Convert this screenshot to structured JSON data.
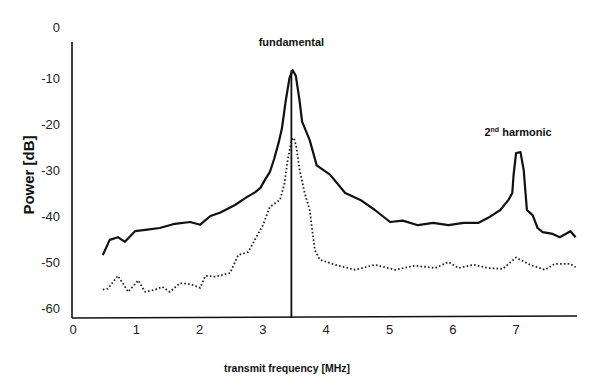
{
  "chart_data": {
    "type": "line",
    "title": "",
    "xlabel": "transmit frequency [MHz]",
    "ylabel": "Power [dB]",
    "xlim": [
      0,
      7.95
    ],
    "ylim": [
      -63,
      0
    ],
    "x_ticks": [
      0,
      1,
      2,
      3,
      4,
      5,
      6,
      7
    ],
    "y_ticks": [
      0,
      -10,
      -20,
      -30,
      -40,
      -50,
      -60
    ],
    "grid": false,
    "legend": null,
    "annotations": [
      {
        "text": "fundamental",
        "x": 3.45,
        "y": -2.5
      },
      {
        "text": "2nd harmonic",
        "sup": "nd",
        "base": "2",
        "rest": " harmonic",
        "x": 7.0,
        "y": -22.5
      }
    ],
    "vertical_line": {
      "x": 3.45,
      "y_from": -63,
      "y_to": -8.3
    },
    "series": [
      {
        "name": "solid",
        "style": "solid",
        "color": "#111111",
        "x": [
          0.47,
          0.58,
          0.71,
          0.82,
          0.98,
          1.14,
          1.37,
          1.61,
          1.85,
          2.01,
          2.17,
          2.32,
          2.56,
          2.72,
          2.88,
          2.96,
          3.03,
          3.11,
          3.18,
          3.25,
          3.3,
          3.36,
          3.42,
          3.47,
          3.52,
          3.58,
          3.62,
          3.74,
          3.85,
          4.06,
          4.3,
          4.54,
          4.77,
          5.01,
          5.21,
          5.45,
          5.69,
          5.93,
          6.17,
          6.4,
          6.56,
          6.75,
          6.88,
          6.94,
          6.96,
          7.0,
          7.07,
          7.12,
          7.17,
          7.26,
          7.34,
          7.42,
          7.58,
          7.69,
          7.86,
          7.94
        ],
        "y": [
          -48.5,
          -45.2,
          -44.6,
          -45.6,
          -43.3,
          -43.0,
          -42.6,
          -41.7,
          -41.3,
          -41.9,
          -40.0,
          -39.3,
          -37.6,
          -36.1,
          -34.8,
          -33.9,
          -32.2,
          -30.4,
          -27.5,
          -24.0,
          -21.0,
          -15.0,
          -10.0,
          -8.3,
          -9.5,
          -15.0,
          -19.5,
          -23.5,
          -29.0,
          -31.0,
          -35.0,
          -36.5,
          -38.7,
          -41.3,
          -41.0,
          -42.0,
          -41.5,
          -42.0,
          -41.5,
          -41.5,
          -40.4,
          -38.7,
          -36.5,
          -35.0,
          -31.0,
          -26.3,
          -26.1,
          -30.0,
          -38.7,
          -39.8,
          -42.6,
          -43.5,
          -43.9,
          -44.6,
          -43.3,
          -44.6
        ]
      },
      {
        "name": "dotted",
        "style": "dotted",
        "color": "#222222",
        "x": [
          0.47,
          0.55,
          0.71,
          0.79,
          0.87,
          1.03,
          1.14,
          1.3,
          1.41,
          1.53,
          1.69,
          1.85,
          2.01,
          2.09,
          2.25,
          2.48,
          2.61,
          2.77,
          2.88,
          3.0,
          3.11,
          3.27,
          3.34,
          3.39,
          3.45,
          3.49,
          3.53,
          3.58,
          3.66,
          3.74,
          3.82,
          3.9,
          4.14,
          4.46,
          4.77,
          5.09,
          5.4,
          5.72,
          5.93,
          6.09,
          6.33,
          6.56,
          6.79,
          7.0,
          7.22,
          7.46,
          7.61,
          7.85,
          7.94
        ],
        "y": [
          -56.0,
          -55.8,
          -53.0,
          -54.7,
          -56.5,
          -54.0,
          -56.5,
          -56.0,
          -55.4,
          -56.5,
          -54.6,
          -54.8,
          -55.6,
          -53.0,
          -53.2,
          -52.4,
          -48.5,
          -47.8,
          -45.0,
          -42.0,
          -38.0,
          -36.5,
          -33.0,
          -28.0,
          -23.5,
          -23.0,
          -25.0,
          -30.0,
          -35.0,
          -38.7,
          -47.4,
          -49.5,
          -50.6,
          -51.7,
          -50.6,
          -51.7,
          -50.8,
          -51.3,
          -50.0,
          -51.3,
          -50.6,
          -51.3,
          -51.5,
          -49.0,
          -50.6,
          -51.7,
          -50.4,
          -50.4,
          -51.1
        ]
      }
    ]
  }
}
